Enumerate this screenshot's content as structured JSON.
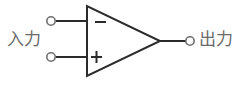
{
  "diagram": {
    "type": "operational-amplifier-schematic",
    "title": "",
    "background_color": "#ffffff",
    "line_color": "#2b2b2b",
    "text_color": "#6b6b6b",
    "labels": {
      "input": "入力",
      "output": "出力"
    },
    "terminals": [
      {
        "name": "inverting-input",
        "symbol": "−",
        "label": "入力",
        "node_x": 51,
        "node_y": 21,
        "polarity": "negative"
      },
      {
        "name": "non-inverting-input",
        "symbol": "+",
        "label": "入力",
        "node_x": 51,
        "node_y": 57,
        "polarity": "positive"
      },
      {
        "name": "output",
        "symbol": "",
        "label": "出力",
        "node_x": 190,
        "node_y": 41,
        "polarity": "out"
      }
    ],
    "amplifier_body": {
      "shape": "triangle",
      "apex_x": 160,
      "apex_y": 41,
      "left_x": 86,
      "top_y": 6,
      "bottom_y": 76
    },
    "signs": {
      "minus": "−",
      "plus": "+"
    }
  }
}
